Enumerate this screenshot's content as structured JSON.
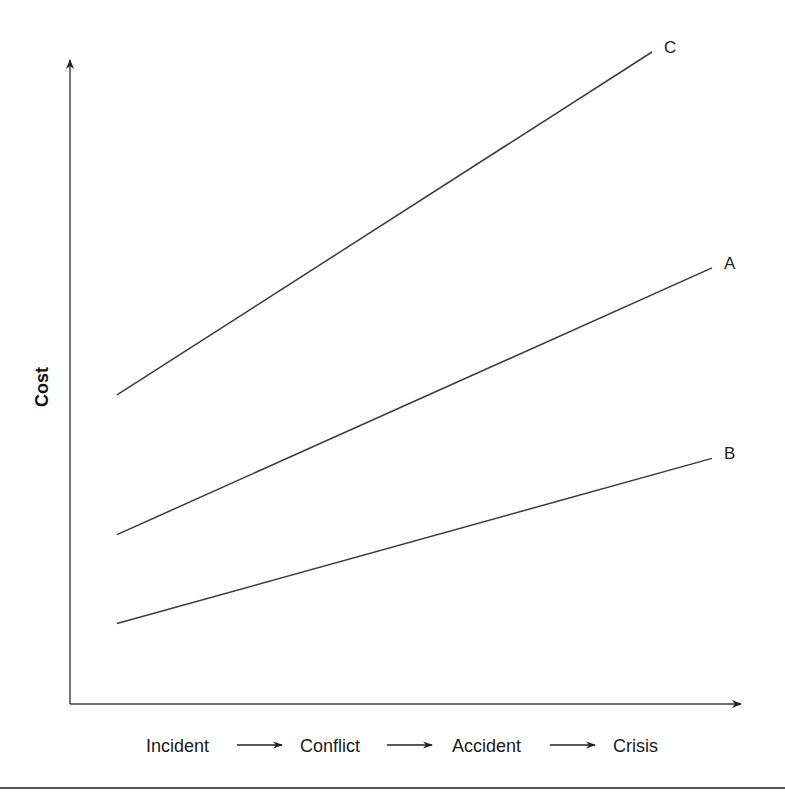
{
  "chart_data": {
    "type": "line",
    "title": "",
    "xlabel": "Incident → Conflict → Accident → Crisis",
    "ylabel": "Cost",
    "x_stages": [
      "Incident",
      "Conflict",
      "Accident",
      "Crisis"
    ],
    "x_range": [
      0,
      1
    ],
    "y_range": [
      0,
      1
    ],
    "grid": false,
    "axis_ticks": false,
    "series": [
      {
        "name": "C",
        "x": [
          0,
          1
        ],
        "y": [
          0.46,
          1.0
        ]
      },
      {
        "name": "A",
        "x": [
          0,
          1
        ],
        "y": [
          0.24,
          0.66
        ]
      },
      {
        "name": "B",
        "x": [
          0,
          1
        ],
        "y": [
          0.1,
          0.36
        ]
      }
    ],
    "series_color": "#3a3a3a",
    "legend": "direct labels at line ends"
  }
}
